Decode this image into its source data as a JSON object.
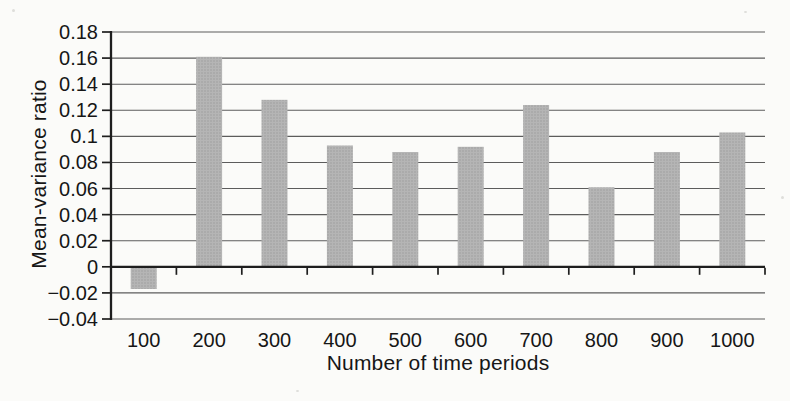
{
  "chart_data": {
    "type": "bar",
    "xlabel": "Number of time periods",
    "ylabel": "Mean-variance ratio",
    "categories": [
      "100",
      "200",
      "300",
      "400",
      "500",
      "600",
      "700",
      "800",
      "900",
      "1000"
    ],
    "values": [
      -0.017,
      0.161,
      0.128,
      0.093,
      0.088,
      0.092,
      0.124,
      0.061,
      0.088,
      0.103
    ],
    "ylim": [
      -0.04,
      0.18
    ],
    "y_tick_step": 0.02,
    "y_ticks": [
      {
        "label": "0.18",
        "value": 0.18
      },
      {
        "label": "0.16",
        "value": 0.16
      },
      {
        "label": "0.14",
        "value": 0.14
      },
      {
        "label": "0.12",
        "value": 0.12
      },
      {
        "label": "0.1",
        "value": 0.1
      },
      {
        "label": "0.08",
        "value": 0.08
      },
      {
        "label": "0.06",
        "value": 0.06
      },
      {
        "label": "0.04",
        "value": 0.04
      },
      {
        "label": "0.02",
        "value": 0.02
      },
      {
        "label": "0",
        "value": 0
      },
      {
        "label": "−0.02",
        "value": -0.02
      },
      {
        "label": "−0.04",
        "value": -0.04
      }
    ],
    "grid": true,
    "legend": null,
    "colors": {
      "bar_fill": "#b5b5b5",
      "bar_stipple": "#9a9a9a",
      "grid_line": "#5c5c5c",
      "axis_line": "#1e1e1e",
      "text": "#161616",
      "background": "#fbfbf9"
    }
  }
}
